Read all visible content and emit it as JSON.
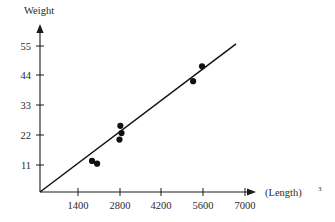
{
  "chart_data": {
    "type": "scatter",
    "title": "",
    "xlabel": "(Length)³",
    "xlabel_base": "(Length)",
    "xlabel_exponent": "3",
    "ylabel": "Weight",
    "xlim": [
      0,
      7700
    ],
    "ylim": [
      0,
      59
    ],
    "xticks": [
      1400,
      2800,
      4200,
      5600,
      7000
    ],
    "xtick_labels": [
      "1400",
      "2800",
      "4200",
      "5600",
      "7000"
    ],
    "yticks": [
      11,
      22,
      33,
      44,
      55
    ],
    "ytick_labels": [
      "11",
      "22",
      "33",
      "44",
      "55"
    ],
    "grid": false,
    "legend": "none",
    "marker_color": "#111111",
    "line_color": "#111111",
    "axis_color": "#1a1a1a",
    "background": "#ffffff",
    "points": [
      {
        "x": 1870,
        "y": 12.5
      },
      {
        "x": 2040,
        "y": 11.5
      },
      {
        "x": 2790,
        "y": 20.4
      },
      {
        "x": 2860,
        "y": 22.8
      },
      {
        "x": 2820,
        "y": 25.5
      },
      {
        "x": 5260,
        "y": 42.0
      },
      {
        "x": 5560,
        "y": 47.5
      }
    ],
    "fit_line": {
      "label": "least-squares line through origin",
      "x_start": 0,
      "y_start": 0,
      "x_end": 6700,
      "y_end": 55.8
    }
  }
}
